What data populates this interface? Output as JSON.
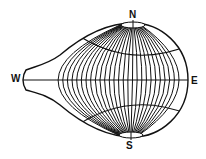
{
  "diagram": {
    "type": "map-projection-graticule",
    "labels": {
      "north": "N",
      "south": "S",
      "west": "W",
      "east": "E"
    },
    "line_color": "#111111",
    "background": "#ffffff"
  }
}
